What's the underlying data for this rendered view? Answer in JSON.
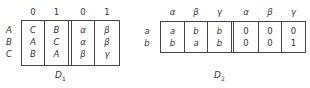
{
  "d1": {
    "caption": "D",
    "caption_sub": "1",
    "col_headers": [
      "0",
      "1",
      "0",
      "1"
    ],
    "row_labels": [
      "A",
      "B",
      "C"
    ],
    "left_block": [
      [
        "C",
        "B"
      ],
      [
        "A",
        "C"
      ],
      [
        "B",
        "A"
      ]
    ],
    "right_block": [
      [
        "α",
        "β"
      ],
      [
        "α",
        "β"
      ],
      [
        "β",
        "γ"
      ]
    ]
  },
  "d2": {
    "caption": "D",
    "caption_sub": "2",
    "col_headers": [
      "α",
      "β",
      "γ",
      "α",
      "β",
      "γ"
    ],
    "row_labels": [
      "a",
      "b"
    ],
    "left_block": [
      [
        "a",
        "b",
        "b"
      ],
      [
        "b",
        "a",
        "b"
      ]
    ],
    "right_block": [
      [
        "0",
        "0",
        "0"
      ],
      [
        "0",
        "0",
        "1"
      ]
    ]
  }
}
